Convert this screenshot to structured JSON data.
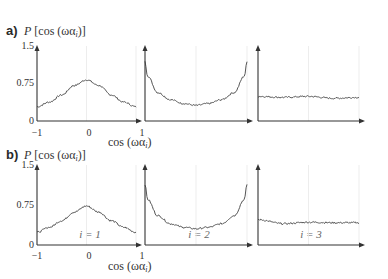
{
  "figure": {
    "rows": [
      {
        "label": "a)",
        "ylabel": "P [cos (ωα_i)]",
        "ylabel_main": "P",
        "ylabel_rest": "[cos (ωα",
        "ylabel_sub": "i",
        "ylabel_end": ")]",
        "yticks": [
          "1.5",
          "0.75",
          "0"
        ],
        "xticks": [
          "−1",
          "0",
          "1"
        ],
        "xlabel_main": "cos (ωα",
        "xlabel_sub": "i",
        "xlabel_end": ")",
        "panel_labels": [
          "",
          "",
          ""
        ]
      },
      {
        "label": "b)",
        "ylabel": "P [cos (ωα_i)]",
        "ylabel_main": "P",
        "ylabel_rest": "[cos (ωα",
        "ylabel_sub": "i",
        "ylabel_end": ")]",
        "yticks": [
          "1.5",
          "0.75",
          "0"
        ],
        "xticks": [
          "−1",
          "0",
          "1"
        ],
        "xlabel_main": "cos (ωα",
        "xlabel_sub": "i",
        "xlabel_end": ")",
        "panel_labels": [
          "i = 1",
          "i = 2",
          "i = 3"
        ]
      }
    ]
  },
  "chart_data": [
    {
      "type": "line",
      "title": "a) i = 1",
      "xlabel": "cos (ωα_i)",
      "ylabel": "P [cos (ωα_i)]",
      "xlim": [
        -1,
        1
      ],
      "ylim": [
        0,
        1.5
      ],
      "x": [
        -1,
        -0.75,
        -0.5,
        -0.25,
        0,
        0.25,
        0.5,
        0.75,
        1
      ],
      "values": [
        0.3,
        0.4,
        0.55,
        0.75,
        0.87,
        0.75,
        0.55,
        0.4,
        0.3
      ]
    },
    {
      "type": "line",
      "title": "a) i = 2",
      "xlabel": "cos (ωα_i)",
      "ylabel": "P [cos (ωα_i)]",
      "xlim": [
        -1,
        1
      ],
      "ylim": [
        0,
        1.5
      ],
      "x": [
        -1,
        -0.95,
        -0.75,
        -0.5,
        -0.25,
        0,
        0.25,
        0.5,
        0.75,
        0.95,
        1
      ],
      "values": [
        1.25,
        0.95,
        0.6,
        0.45,
        0.37,
        0.33,
        0.37,
        0.45,
        0.6,
        0.95,
        1.25
      ]
    },
    {
      "type": "line",
      "title": "a) i = 3",
      "xlabel": "cos (ωα_i)",
      "ylabel": "P [cos (ωα_i)]",
      "xlim": [
        -1,
        1
      ],
      "ylim": [
        0,
        1.5
      ],
      "x": [
        -1,
        -0.5,
        0,
        0.5,
        1
      ],
      "values": [
        0.52,
        0.5,
        0.52,
        0.48,
        0.5
      ]
    },
    {
      "type": "line",
      "title": "b) i = 1",
      "xlabel": "cos (ωα_i)",
      "ylabel": "P [cos (ωα_i)]",
      "xlim": [
        -1,
        1
      ],
      "ylim": [
        0,
        1.5
      ],
      "x": [
        -1,
        -0.75,
        -0.5,
        -0.25,
        0,
        0.25,
        0.5,
        0.75,
        1
      ],
      "values": [
        0.25,
        0.35,
        0.48,
        0.65,
        0.77,
        0.65,
        0.48,
        0.35,
        0.25
      ]
    },
    {
      "type": "line",
      "title": "b) i = 2",
      "xlabel": "cos (ωα_i)",
      "ylabel": "P [cos (ωα_i)]",
      "xlim": [
        -1,
        1
      ],
      "ylim": [
        0,
        1.5
      ],
      "x": [
        -1,
        -0.95,
        -0.75,
        -0.5,
        -0.25,
        0,
        0.25,
        0.5,
        0.75,
        0.95,
        1
      ],
      "values": [
        1.2,
        0.9,
        0.58,
        0.42,
        0.35,
        0.32,
        0.35,
        0.42,
        0.58,
        0.9,
        1.2
      ]
    },
    {
      "type": "line",
      "title": "b) i = 3",
      "xlabel": "cos (ωα_i)",
      "ylabel": "P [cos (ωα_i)]",
      "xlim": [
        -1,
        1
      ],
      "ylim": [
        0,
        1.5
      ],
      "x": [
        -1,
        -0.5,
        0,
        0.5,
        1
      ],
      "values": [
        0.5,
        0.42,
        0.45,
        0.44,
        0.44
      ]
    }
  ]
}
